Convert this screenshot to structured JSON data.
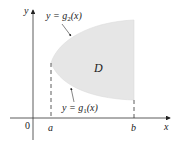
{
  "diagram": {
    "axes": {
      "x_label": "x",
      "y_label": "y",
      "origin_label": "0"
    },
    "ticks": {
      "a_label": "a",
      "b_label": "b"
    },
    "region": {
      "label": "D",
      "fill_color": "#e6e6e6"
    },
    "curves": {
      "upper": {
        "prefix": "y = g",
        "sub": "2",
        "suffix": "(x)"
      },
      "lower": {
        "prefix": "y = g",
        "sub": "1",
        "suffix": "(x)"
      }
    },
    "colors": {
      "axis": "#333333",
      "text": "#222222"
    }
  }
}
